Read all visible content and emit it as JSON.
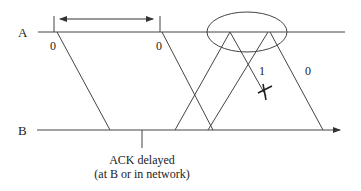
{
  "diagram": {
    "type": "timing-sequence",
    "colors": {
      "line": "#444444",
      "text": "#222222",
      "background": "#ffffff"
    },
    "hosts": [
      {
        "label": "A"
      },
      {
        "label": "B"
      }
    ],
    "segments": [
      {
        "label": "0",
        "from": "A",
        "to": "B",
        "note": "first send"
      },
      {
        "label": "0",
        "from": "A",
        "to": "B",
        "note": "retransmit after timeout"
      },
      {
        "label": "1",
        "from": "A",
        "to": "B",
        "lost": true
      },
      {
        "label": "0",
        "from": "A",
        "to": "B"
      }
    ],
    "acks": [
      {
        "from": "B",
        "to": "A"
      },
      {
        "from": "B",
        "to": "A"
      }
    ],
    "annotations": {
      "ack_delayed_line1": "ACK delayed",
      "ack_delayed_line2": "(at B or in network)",
      "timeout_interval": "double-headed arrow between transmissions",
      "highlight": "ellipse around A timeline",
      "loss_marker": "X"
    }
  }
}
